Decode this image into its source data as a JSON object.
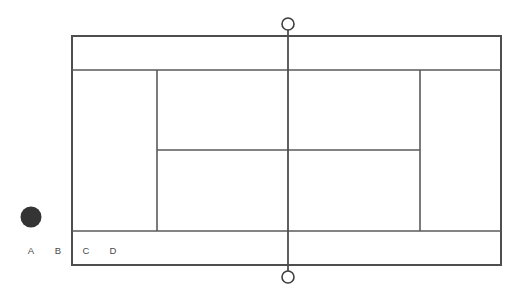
{
  "diagram": {
    "background_color": "#ffffff",
    "line_color": "#5a5a5a",
    "outer_line_color": "#4e4e4e",
    "ball_color": "#343434",
    "label_color": "#4a4a4a"
  },
  "court": {
    "doubles_left_x": 72,
    "doubles_right_x": 501,
    "doubles_top_y": 36,
    "doubles_bottom_y": 265,
    "singles_top_y": 70,
    "singles_bottom_y": 231,
    "service_line_left_x": 157,
    "service_line_right_x": 420,
    "center_service_line_y": 150
  },
  "net": {
    "x": 288,
    "top_y": 24,
    "bottom_y": 277,
    "post_radius": 6,
    "line_top_y": 30,
    "line_bottom_y": 271
  },
  "ball": {
    "name": "ball",
    "cx": 31,
    "cy": 217,
    "r": 10.5
  },
  "labels": [
    {
      "id": "A",
      "text": "A",
      "x": 31,
      "y": 251
    },
    {
      "id": "B",
      "text": "B",
      "x": 58,
      "y": 251
    },
    {
      "id": "C",
      "text": "C",
      "x": 86,
      "y": 251
    },
    {
      "id": "D",
      "text": "D",
      "x": 113,
      "y": 251
    }
  ]
}
